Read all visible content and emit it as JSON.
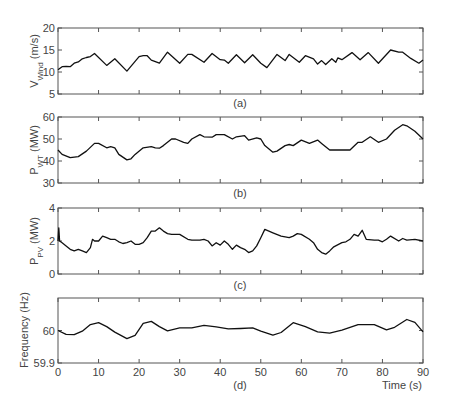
{
  "chart_data": [
    {
      "type": "line",
      "panel": "(a)",
      "ylabel": "V_Wind (m/s)",
      "ylabel_main": "V",
      "ylabel_sub": "Wind",
      "ylabel_unit": " (m/s)",
      "ylim": [
        5,
        20
      ],
      "yticks": [
        5,
        10,
        15,
        20
      ],
      "xlim": [
        0,
        90
      ],
      "x": [
        0,
        1,
        2,
        3,
        4,
        5,
        6,
        7,
        8,
        9,
        12,
        14,
        17,
        20,
        21,
        22,
        23,
        25,
        27,
        30,
        32,
        33,
        36,
        38,
        40,
        41,
        42,
        44,
        46,
        48,
        50,
        51.5,
        54,
        56,
        57,
        59.5,
        61,
        63,
        64,
        65,
        66,
        67.5,
        68.5,
        69,
        70,
        72.5,
        74.5,
        76.5,
        79,
        82,
        84,
        85,
        87,
        89,
        90
      ],
      "values": [
        10.5,
        11.2,
        11.3,
        11.2,
        12,
        12.3,
        13,
        13.3,
        13.5,
        14.2,
        11.5,
        13,
        10.2,
        13.5,
        13.7,
        13.7,
        12.7,
        12,
        14.5,
        12,
        14,
        14,
        12.2,
        14.2,
        12.8,
        12.7,
        12,
        13.9,
        12.1,
        13.9,
        12,
        11,
        14,
        12.6,
        14,
        12.2,
        13.7,
        13,
        11.8,
        12.6,
        11.7,
        13,
        12.2,
        13.2,
        12.8,
        14.4,
        12.8,
        14.4,
        12,
        15,
        14.5,
        14.5,
        13.1,
        12,
        12.7
      ]
    },
    {
      "type": "line",
      "panel": "(b)",
      "ylabel": "P_WT (MW)",
      "ylabel_main": "P",
      "ylabel_sub": "WT",
      "ylabel_unit": " (MW)",
      "ylim": [
        30,
        60
      ],
      "yticks": [
        30,
        40,
        50,
        60
      ],
      "xlim": [
        0,
        90
      ],
      "x": [
        0,
        1,
        3,
        5,
        7,
        9,
        10,
        12,
        13,
        14,
        15,
        17,
        18,
        19,
        21,
        23,
        24,
        25,
        26,
        28,
        29,
        31,
        32,
        33,
        35,
        36,
        38,
        39,
        41,
        43,
        44,
        46,
        47,
        49,
        50,
        51,
        53,
        54,
        56,
        57,
        58,
        60,
        62,
        64,
        65,
        67,
        68,
        70,
        71,
        72,
        74,
        75,
        77,
        79,
        81,
        83,
        85,
        86,
        88,
        90
      ],
      "values": [
        45,
        43,
        41.5,
        42,
        44.5,
        48,
        48,
        46,
        46.5,
        46,
        43,
        40.5,
        41,
        43,
        46,
        46.5,
        46,
        45.8,
        47,
        50,
        50,
        48.5,
        48,
        50,
        52,
        51,
        50.8,
        52,
        52,
        50,
        51,
        51.5,
        49.5,
        50.5,
        50,
        47,
        44,
        44.5,
        47,
        47.5,
        47,
        49.5,
        48,
        49.5,
        48,
        45,
        45,
        45,
        45,
        45,
        48.5,
        48.5,
        51,
        48.5,
        50,
        54,
        56.5,
        56,
        53.5,
        50
      ]
    },
    {
      "type": "line",
      "panel": "(c)",
      "ylabel": "P_PV (MW)",
      "ylabel_main": "P",
      "ylabel_sub": "PV",
      "ylabel_unit": " (MW)",
      "ylim": [
        0,
        4
      ],
      "yticks": [
        0,
        2,
        4
      ],
      "xlim": [
        0,
        90
      ],
      "x": [
        0,
        0.2,
        0.4,
        1,
        2,
        3,
        4,
        5,
        6,
        7,
        8,
        8.5,
        9,
        10,
        11,
        12,
        13,
        14,
        15,
        16,
        17,
        18,
        19,
        20,
        21,
        22,
        23,
        24,
        25,
        26,
        27,
        28,
        30,
        32,
        33,
        35,
        36,
        37,
        38,
        39,
        40,
        41,
        42,
        43,
        44,
        45,
        46,
        47,
        48,
        49,
        50,
        51,
        52,
        53,
        55,
        57,
        58,
        59,
        60,
        62,
        63,
        64,
        65,
        66,
        67,
        68,
        70,
        71,
        72,
        73,
        74,
        75,
        76,
        78,
        79,
        80,
        81,
        82,
        84,
        85,
        86,
        88,
        90
      ],
      "values": [
        2,
        2.8,
        2,
        1.9,
        1.7,
        1.5,
        1.4,
        1.5,
        1.4,
        1.3,
        1.6,
        2.1,
        2,
        2,
        2.3,
        2.2,
        2.1,
        2.1,
        1.95,
        1.85,
        1.9,
        2,
        1.8,
        1.8,
        1.9,
        2.2,
        2.6,
        2.6,
        2.8,
        2.6,
        2.45,
        2.4,
        2.4,
        2.1,
        2.05,
        2.05,
        2.1,
        2,
        1.7,
        1.9,
        1.75,
        2,
        1.8,
        1.5,
        1.75,
        1.6,
        1.5,
        1.3,
        1.4,
        1.7,
        2.2,
        2.7,
        2.6,
        2.5,
        2.3,
        2.2,
        2.3,
        2.45,
        2.4,
        2.1,
        1.9,
        1.5,
        1.3,
        1.2,
        1.4,
        1.65,
        1.9,
        1.95,
        2.1,
        2.4,
        2.3,
        2.65,
        2.1,
        2.05,
        2.05,
        1.95,
        2.1,
        2.3,
        2,
        2.15,
        2.05,
        2.1,
        2
      ]
    },
    {
      "type": "line",
      "panel": "(d)",
      "ylabel": "Frequency (Hz)",
      "ylim": [
        59.9,
        60.1
      ],
      "yticks": [
        59.9,
        60
      ],
      "xlim": [
        0,
        90
      ],
      "x": [
        0,
        2,
        4,
        6,
        8,
        10,
        12,
        14,
        17,
        19,
        21,
        23,
        25,
        27,
        30,
        33,
        36,
        39,
        42,
        45,
        48,
        50,
        53,
        55,
        58,
        61,
        64,
        67,
        70,
        74,
        78,
        81,
        83,
        86,
        88,
        90
      ],
      "values": [
        60,
        59.988,
        59.987,
        59.998,
        60.018,
        60.024,
        60.012,
        59.995,
        59.975,
        59.985,
        60.022,
        60.028,
        60.012,
        59.999,
        60.008,
        60.008,
        60.016,
        60.011,
        60.005,
        60.006,
        60.008,
        59.998,
        59.986,
        59.994,
        60.024,
        60.012,
        59.996,
        59.992,
        60.001,
        60.018,
        60.018,
        60.002,
        60.01,
        60.034,
        60.025,
        59.996
      ]
    }
  ],
  "x_axis": {
    "label": "Time (s)",
    "ticks": [
      0,
      10,
      20,
      30,
      40,
      50,
      60,
      70,
      80,
      90
    ]
  },
  "captions": [
    "(a)",
    "(b)",
    "(c)",
    "(d)"
  ]
}
